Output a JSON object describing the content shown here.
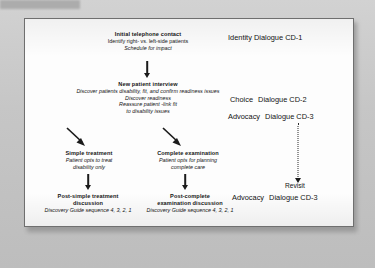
{
  "slide": {
    "nodes": [
      {
        "id": "initial-telephone-contact",
        "title": "Initial telephone contact",
        "lines": [
          {
            "text": "Identify right- vs. left-side patients",
            "style": "plain"
          },
          {
            "text": "Schedule for impact",
            "style": "italic"
          }
        ]
      },
      {
        "id": "new-patient-interview",
        "title": "New patient interview",
        "lines": [
          {
            "text": "Discover patients disability, fit, and confirm readiness issues",
            "style": "italic"
          },
          {
            "text": "Discover readiness",
            "style": "italic"
          },
          {
            "text": "Reassure patient -link fit",
            "style": "italic"
          },
          {
            "text": "to disability issues",
            "style": "italic"
          }
        ]
      },
      {
        "id": "simple-treatment",
        "title": "Simple treatment",
        "lines": [
          {
            "text": "Patient opts to treat",
            "style": "italic"
          },
          {
            "text": "disability only",
            "style": "italic"
          }
        ]
      },
      {
        "id": "complete-examination",
        "title": "Complete examination",
        "lines": [
          {
            "text": "Patient opts for planning",
            "style": "italic"
          },
          {
            "text": "complete care",
            "style": "italic"
          }
        ]
      },
      {
        "id": "post-simple-treatment-discussion",
        "title_line1": "Post-simple treatment",
        "title_line2": "discussion",
        "lines": [
          {
            "text": "Discovery Guide sequence 4, 3, 2, 1",
            "style": "italic"
          }
        ]
      },
      {
        "id": "post-complete-examination-discussion",
        "title_line1": "Post-complete",
        "title_line2": "examination discussion",
        "lines": [
          {
            "text": "Discovery Guide sequence 4, 3, 2, 1",
            "style": "italic"
          }
        ]
      }
    ],
    "side_labels": [
      {
        "id": "identity-cd1",
        "prefix": "Identity",
        "text": "Dialogue CD-1"
      },
      {
        "id": "choice-cd2",
        "prefix": "Choice",
        "text": "Dialogue CD-2"
      },
      {
        "id": "advocacy-cd3",
        "prefix": "Advocacy",
        "text": "Dialogue CD-3"
      }
    ],
    "revisit": {
      "id": "revisit-advocacy-cd3",
      "caption": "Revisit",
      "prefix": "Advocacy",
      "text": "Dialogue CD-3"
    }
  }
}
